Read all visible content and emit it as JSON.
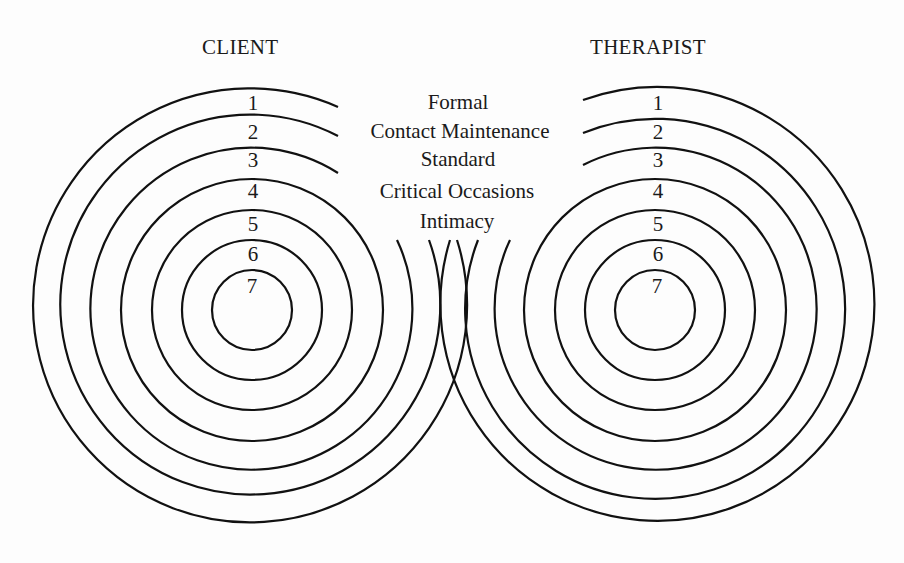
{
  "diagram": {
    "left_title": "CLIENT",
    "right_title": "THERAPIST",
    "levels": [
      {
        "number": "1",
        "label": "Formal"
      },
      {
        "number": "2",
        "label": "Contact Maintenance"
      },
      {
        "number": "3",
        "label": "Standard"
      },
      {
        "number": "4",
        "label": "Critical Occasions"
      },
      {
        "number": "5",
        "label": "Intimacy"
      },
      {
        "number": "6",
        "label": ""
      },
      {
        "number": "7",
        "label": ""
      }
    ],
    "line_color": "#111111",
    "background": "#fdfdfd"
  }
}
